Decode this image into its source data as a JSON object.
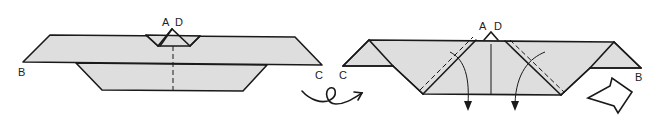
{
  "figures": [
    {
      "id": "step-left",
      "labels": {
        "top_left": "A",
        "top_right": "D",
        "left_corner": "B",
        "right_corner": "C"
      }
    },
    {
      "id": "step-right",
      "labels": {
        "top_left": "A",
        "top_right": "D",
        "left_corner": "C",
        "right_corner": "B"
      }
    }
  ],
  "symbols": {
    "turn_over": "turn-over-arrow",
    "push_in": "push-arrow",
    "fold_down": "fold-down-arrows"
  },
  "colors": {
    "paper": "#dedede",
    "line": "#1a1a1a",
    "background": "#ffffff"
  }
}
